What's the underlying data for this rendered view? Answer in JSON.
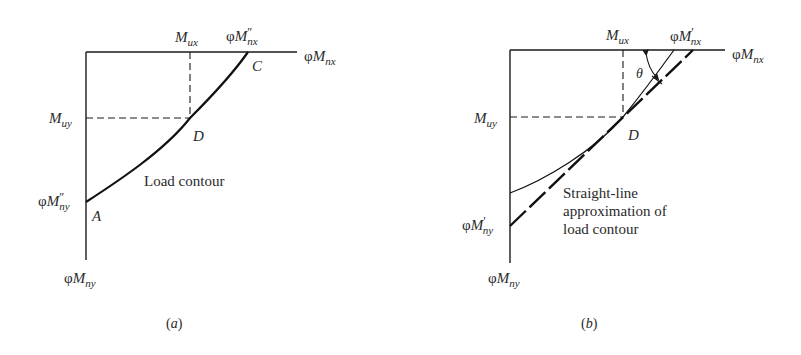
{
  "panel_a": {
    "caption": "(a)",
    "axis_x_label": {
      "phi": "φ",
      "M": "M",
      "sub": "nx"
    },
    "axis_y_label": {
      "phi": "φ",
      "M": "M",
      "sub": "ny"
    },
    "mux_label": {
      "M": "M",
      "sub": "ux"
    },
    "muy_label": {
      "M": "M",
      "sub": "uy"
    },
    "nx_dprime_label": {
      "phi": "φ",
      "M": "M",
      "prime": "″",
      "sub": "nx"
    },
    "ny_dprime_label": {
      "phi": "φ",
      "M": "M",
      "prime": "″",
      "sub": "ny"
    },
    "point_c": "C",
    "point_d": "D",
    "point_a": "A",
    "curve_label": "Load contour"
  },
  "panel_b": {
    "caption": "(b)",
    "axis_x_label": {
      "phi": "φ",
      "M": "M",
      "sub": "nx"
    },
    "axis_y_label": {
      "phi": "φ",
      "M": "M",
      "sub": "ny"
    },
    "mux_label": {
      "M": "M",
      "sub": "ux"
    },
    "muy_label": {
      "M": "M",
      "sub": "uy"
    },
    "nx_prime_label": {
      "phi": "φ",
      "M": "M",
      "prime": "′",
      "sub": "nx"
    },
    "ny_prime_label": {
      "phi": "φ",
      "M": "M",
      "prime": "′",
      "sub": "ny"
    },
    "point_d": "D",
    "angle_label": "θ",
    "annotation_lines": [
      "Straight-line",
      "approximation of",
      "load contour"
    ]
  },
  "colors": {
    "ink": "#1a1a1a",
    "text": "#2a2a2a",
    "background": "#ffffff"
  }
}
